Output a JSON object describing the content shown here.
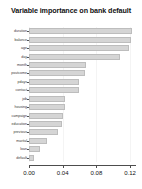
{
  "chart_data": {
    "type": "bar",
    "orientation": "horizontal",
    "title": "Variable importance on bank default",
    "xlabel": "",
    "ylabel": "",
    "xlim": [
      0.0,
      0.127
    ],
    "xticks": [
      0.0,
      0.04,
      0.08,
      0.12
    ],
    "xtick_labels": [
      "0.00",
      "0.04",
      "0.08",
      "0.12"
    ],
    "grid": false,
    "legend": null,
    "bar_color": "#d5d5d5",
    "bar_border_color": "#bdbdbd",
    "categories": [
      "duration",
      "balance",
      "age",
      "day",
      "month",
      "poutcome",
      "pdays",
      "contact",
      "job",
      "housing",
      "campaign",
      "education",
      "previous",
      "marital",
      "loan",
      "default"
    ],
    "values": [
      0.1225,
      0.1205,
      0.1185,
      0.1085,
      0.068,
      0.0665,
      0.0595,
      0.059,
      0.043,
      0.0425,
      0.0405,
      0.039,
      0.034,
      0.0215,
      0.0135,
      0.006
    ]
  }
}
